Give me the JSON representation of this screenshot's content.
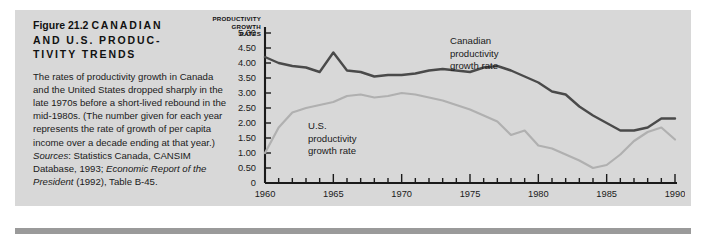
{
  "figure": {
    "number_label": "Figure 21.2",
    "title_line1": "CANADIAN",
    "title_line2": "AND U.S. PRODUC-",
    "title_line3": "TIVITY TRENDS",
    "caption_text": "The rates of productivity growth in Canada and the United States dropped sharply in the late 1970s before a short-lived rebound in the mid-1980s. (The number given for each year represents the rate of growth of per capita income over a decade ending at that year.) ",
    "sources_label": "Sources",
    "sources_colon": ":",
    "sources_line1": " Statistics Canada, CANSIM Database, 1993; ",
    "sources_italic": "Economic Report of the President",
    "sources_line2": " (1992), Table B-45."
  },
  "colors": {
    "panel_background": "#d8d8d8",
    "page_background": "#ffffff",
    "canadian_line": "#4a4a4a",
    "us_line": "#b0b0b0",
    "axis": "#1a1a1a",
    "text": "#1a1a1a",
    "bottom_rule": "#9a9a9a"
  },
  "chart_data": {
    "type": "line",
    "title": "",
    "xlabel": "",
    "ylabel": "PRODUCTIVITY GROWTH RATES",
    "ylabel_lines": [
      "PRODUCTIVITY",
      "GROWTH",
      "RATES"
    ],
    "xlim": [
      1960,
      1990
    ],
    "ylim": [
      0,
      5.0
    ],
    "ytick_values": [
      5.0,
      4.5,
      4.0,
      3.5,
      3.0,
      2.5,
      2.0,
      1.5,
      1.0,
      0.5,
      0
    ],
    "ytick_labels": [
      "5.00",
      "4.50",
      "4.00",
      "3.50",
      "3.00",
      "2.50",
      "2.00",
      "1.50",
      "1.00",
      "0.50",
      "0"
    ],
    "xtick_major": [
      1960,
      1965,
      1970,
      1975,
      1980,
      1985,
      1990
    ],
    "xtick_labels": [
      "1960",
      "1965",
      "1970",
      "1975",
      "1980",
      "1985",
      "1990"
    ],
    "xtick_minor_step": 1,
    "grid": false,
    "legend": "inline-annotations",
    "x": [
      1960,
      1961,
      1962,
      1963,
      1964,
      1965,
      1966,
      1967,
      1968,
      1969,
      1970,
      1971,
      1972,
      1973,
      1974,
      1975,
      1976,
      1977,
      1978,
      1979,
      1980,
      1981,
      1982,
      1983,
      1984,
      1985,
      1986,
      1987,
      1988,
      1989,
      1990
    ],
    "series": [
      {
        "name": "Canadian productivity growth rate",
        "label_lines": [
          "Canadian",
          "productivity",
          "growth rate"
        ],
        "color": "#4a4a4a",
        "values": [
          4.2,
          4.0,
          3.9,
          3.85,
          3.7,
          4.35,
          3.75,
          3.7,
          3.55,
          3.6,
          3.6,
          3.65,
          3.75,
          3.8,
          3.75,
          3.7,
          3.85,
          3.9,
          3.75,
          3.55,
          3.35,
          3.05,
          2.95,
          2.55,
          2.25,
          2.0,
          1.75,
          1.75,
          1.85,
          2.15,
          2.15
        ]
      },
      {
        "name": "U.S. productivity growth rate",
        "label_lines": [
          "U.S.",
          "productivity",
          "growth rate"
        ],
        "color": "#b0b0b0",
        "values": [
          1.0,
          1.85,
          2.35,
          2.5,
          2.6,
          2.7,
          2.9,
          2.95,
          2.85,
          2.9,
          3.0,
          2.95,
          2.85,
          2.75,
          2.6,
          2.45,
          2.25,
          2.05,
          1.6,
          1.75,
          1.25,
          1.15,
          0.95,
          0.75,
          0.5,
          0.6,
          0.95,
          1.4,
          1.7,
          1.85,
          1.45
        ]
      }
    ]
  }
}
